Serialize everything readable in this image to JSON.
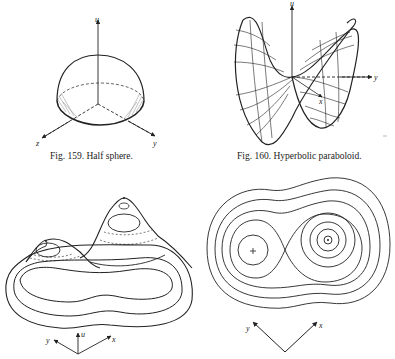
{
  "figures": [
    {
      "id": "fig159",
      "caption": "Fig. 159. Half sphere.",
      "axes": {
        "up": "u",
        "left": "z",
        "right": "y"
      }
    },
    {
      "id": "fig160",
      "caption": "Fig. 160. Hyperbolic paraboloid.",
      "axes": {
        "up": "u",
        "right": "y",
        "front": "x"
      }
    },
    {
      "id": "fig161",
      "caption": "",
      "axes": {
        "left": "y",
        "up": "u",
        "right": "x"
      }
    },
    {
      "id": "fig162",
      "caption": "",
      "axes": {
        "left": "y",
        "right": "x"
      }
    }
  ],
  "colors": {
    "ink": "#222222",
    "background": "#ffffff",
    "hatch": "#888888"
  }
}
